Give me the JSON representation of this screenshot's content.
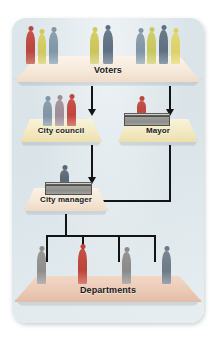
{
  "diagram": {
    "background_color": "#ddE6EA",
    "line_color": "#141414",
    "levels": [
      {
        "id": "voters",
        "label": "Voters",
        "platform_color": "#f5e9dc",
        "people": [
          {
            "color": "#b9463f",
            "group": 1
          },
          {
            "color": "#cfc95e",
            "group": 1
          },
          {
            "color": "#7f96a6",
            "group": 1
          },
          {
            "color": "#cfc95e",
            "group": 2
          },
          {
            "color": "#5d6f80",
            "group": 2
          },
          {
            "color": "#8195a4",
            "group": 3
          },
          {
            "color": "#c6c75f",
            "group": 3
          },
          {
            "color": "#5d6f80",
            "group": 3
          },
          {
            "color": "#ddd06a",
            "group": 3
          }
        ]
      },
      {
        "id": "city-council",
        "label": "City council",
        "platform_color": "#f3eac4",
        "people": [
          {
            "color": "#7f94a4"
          },
          {
            "color": "#9d8b95"
          },
          {
            "color": "#c0463d"
          }
        ]
      },
      {
        "id": "mayor",
        "label": "Mayor",
        "platform_color": "#f3eac4",
        "people": [
          {
            "color": "#b9483d"
          }
        ],
        "has_desk": true
      },
      {
        "id": "city-manager",
        "label": "City manager",
        "platform_color": "#f6e7d7",
        "people": [
          {
            "color": "#5a6673"
          }
        ],
        "has_desk": true
      },
      {
        "id": "departments",
        "label": "Departments",
        "platform_color": "#eccbb8",
        "people": [
          {
            "color": "#8d8d8b"
          },
          {
            "color": "#bd4237"
          },
          {
            "color": "#8a8a88"
          },
          {
            "color": "#6d7a86"
          }
        ]
      }
    ],
    "connectors": [
      {
        "id": "voters-to-city-council",
        "from": "voters",
        "to": "city-council",
        "style": "arrow-down"
      },
      {
        "id": "voters-to-mayor",
        "from": "voters",
        "to": "mayor",
        "style": "arrow-down"
      },
      {
        "id": "city-council-to-city-manager",
        "from": "city-council",
        "to": "city-manager",
        "style": "arrow-down"
      },
      {
        "id": "mayor-to-city-manager",
        "from": "mayor",
        "to": "city-manager",
        "style": "elbow-arrow-left"
      },
      {
        "id": "city-manager-to-departments",
        "from": "city-manager",
        "to": "departments",
        "style": "bracket-four"
      }
    ]
  }
}
